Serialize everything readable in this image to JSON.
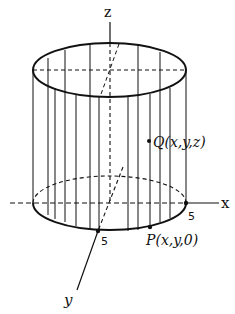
{
  "diagram": {
    "type": "3d-cylinder",
    "axes": {
      "z_label": "z",
      "x_label": "x",
      "y_label": "y"
    },
    "tick_labels": {
      "x_tick": "5",
      "y_tick": "5"
    },
    "points": {
      "Q_label": "Q(x,y,z)",
      "P_label": "P(x,y,0)"
    },
    "colors": {
      "ink": "#111111",
      "background": "#ffffff"
    }
  }
}
